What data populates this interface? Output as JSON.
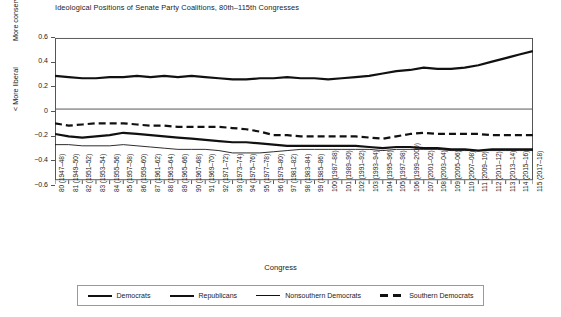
{
  "chart_data": {
    "type": "line",
    "title": "Ideological Positions of Senate Party Coalitions, 80th–115th Congresses",
    "xlabel": "Congress",
    "ylabel_top": "More conservative >",
    "ylabel_bottom": "< More liberal",
    "ylim": [
      -0.6,
      0.6
    ],
    "yticks": [
      0.6,
      0.4,
      0.2,
      0,
      -0.2,
      -0.4,
      -0.6
    ],
    "ytick_labels": [
      "0.6",
      "0.4",
      "0.2",
      "0",
      "−0.2",
      "−0.4",
      "−0.6"
    ],
    "grid": false,
    "legend_position": "bottom",
    "categories": [
      "80 (1947–48)",
      "81 (1949–50)",
      "82 (1951–52)",
      "83 (1953–54)",
      "84 (1955–56)",
      "85 (1957–58)",
      "86 (1959–60)",
      "87 (1961–62)",
      "88 (1963–64)",
      "89 (1965–66)",
      "90 (1967–68)",
      "91 (1969–70)",
      "92 (1971–72)",
      "93 (1973–74)",
      "94 (1975–76)",
      "95 (1977–78)",
      "96 (1979–80)",
      "97 (1981–82)",
      "98 (1983–84)",
      "99 (1985–86)",
      "100 (1987–88)",
      "101 (1989–90)",
      "102 (1991–92)",
      "103 (1993–94)",
      "104 (1995–96)",
      "105 (1997–98)",
      "106 (1999–2000)",
      "107 (2001–02)",
      "108 (2003–04)",
      "109 (2005–06)",
      "110 (2007–08)",
      "111 (2009–10)",
      "112 (2011–12)",
      "113 (2013–14)",
      "114 (2015–16)",
      "115 (2017–18)"
    ],
    "series": [
      {
        "name": "Democrats",
        "style": "thick-solid",
        "values": [
          -0.21,
          -0.23,
          -0.24,
          -0.23,
          -0.22,
          -0.2,
          -0.21,
          -0.22,
          -0.23,
          -0.24,
          -0.25,
          -0.26,
          -0.27,
          -0.28,
          -0.28,
          -0.29,
          -0.3,
          -0.31,
          -0.31,
          -0.31,
          -0.31,
          -0.31,
          -0.31,
          -0.32,
          -0.33,
          -0.32,
          -0.32,
          -0.33,
          -0.33,
          -0.34,
          -0.34,
          -0.35,
          -0.34,
          -0.34,
          -0.34,
          -0.34
        ]
      },
      {
        "name": "Republicans",
        "style": "thick-solid",
        "values": [
          0.28,
          0.27,
          0.26,
          0.26,
          0.27,
          0.27,
          0.28,
          0.27,
          0.28,
          0.27,
          0.28,
          0.27,
          0.26,
          0.25,
          0.25,
          0.26,
          0.26,
          0.27,
          0.26,
          0.26,
          0.25,
          0.26,
          0.27,
          0.28,
          0.3,
          0.32,
          0.33,
          0.35,
          0.34,
          0.34,
          0.35,
          0.37,
          0.4,
          0.43,
          0.46,
          0.49
        ]
      },
      {
        "name": "Nonsouthern Democrats",
        "style": "thin-solid",
        "values": [
          -0.3,
          -0.3,
          -0.31,
          -0.31,
          -0.31,
          -0.3,
          -0.31,
          -0.32,
          -0.33,
          -0.34,
          -0.34,
          -0.34,
          -0.35,
          -0.37,
          -0.37,
          -0.37,
          -0.36,
          -0.35,
          -0.34,
          -0.34,
          -0.34,
          -0.34,
          -0.34,
          -0.34,
          -0.35,
          -0.34,
          -0.34,
          -0.34,
          -0.34,
          -0.35,
          -0.35,
          -0.35,
          -0.35,
          -0.35,
          -0.35,
          -0.35
        ]
      },
      {
        "name": "Southern Democrats",
        "style": "dashed",
        "values": [
          -0.12,
          -0.14,
          -0.13,
          -0.12,
          -0.12,
          -0.12,
          -0.13,
          -0.14,
          -0.14,
          -0.15,
          -0.15,
          -0.15,
          -0.15,
          -0.16,
          -0.17,
          -0.19,
          -0.22,
          -0.22,
          -0.23,
          -0.23,
          -0.23,
          -0.23,
          -0.23,
          -0.24,
          -0.25,
          -0.23,
          -0.21,
          -0.2,
          -0.21,
          -0.21,
          -0.21,
          -0.21,
          -0.22,
          -0.22,
          -0.22,
          -0.22
        ]
      }
    ],
    "legend": [
      {
        "label": "Democrats",
        "style": "thick-solid"
      },
      {
        "label": "Republicans",
        "style": "thick-solid"
      },
      {
        "label": "Nonsouthern Democrats",
        "style": "thin-solid"
      },
      {
        "label": "Southern Democrats",
        "style": "dashed"
      }
    ],
    "colors": {
      "line": "#111111",
      "axis": "#555555",
      "background": "#ffffff"
    }
  }
}
